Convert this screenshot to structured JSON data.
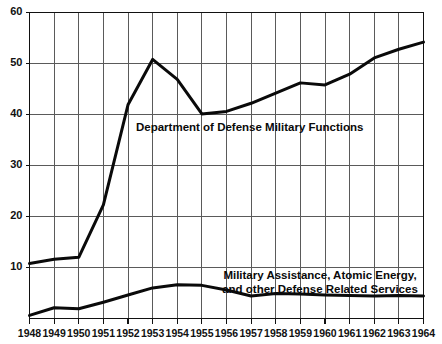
{
  "chart_data": {
    "type": "line",
    "title": "",
    "subtitle": "",
    "xlabel": "",
    "ylabel": "",
    "xlim": [
      1948,
      1964
    ],
    "ylim": [
      0,
      60
    ],
    "grid": true,
    "legend_position": "inline-annotation",
    "x": [
      1948,
      1949,
      1950,
      1951,
      1952,
      1953,
      1954,
      1955,
      1956,
      1957,
      1958,
      1959,
      1960,
      1961,
      1962,
      1963,
      1964
    ],
    "xtick_labels": [
      "1948",
      "1949",
      "1950",
      "1951",
      "1952",
      "1953",
      "1954",
      "1955",
      "1956",
      "1957",
      "1958",
      "1959",
      "1960",
      "1961",
      "1962",
      "1963",
      "1964"
    ],
    "ytick_values": [
      10,
      20,
      30,
      40,
      50,
      60
    ],
    "ytick_labels": [
      "10",
      "20",
      "30",
      "40",
      "50",
      "60"
    ],
    "series": [
      {
        "name": "Department of Defense Military Functions",
        "values": [
          10.8,
          11.6,
          12.0,
          22.3,
          41.9,
          50.8,
          46.9,
          40.1,
          40.6,
          42.2,
          44.2,
          46.2,
          45.8,
          47.9,
          51.1,
          52.8,
          54.2
        ],
        "annotation": "Department of Defense Military Functions"
      },
      {
        "name": "Military Assistance, Atomic Energy, and other Defense Related Services",
        "values": [
          0.6,
          2.1,
          1.9,
          3.2,
          4.6,
          6.0,
          6.6,
          6.5,
          5.6,
          4.4,
          4.9,
          4.8,
          4.6,
          4.5,
          4.4,
          4.5,
          4.4
        ],
        "annotation_line1": "Military Assistance, Atomic Energy,",
        "annotation_line2": "and other Defense Related Services"
      }
    ],
    "colors": {
      "series_line": "#0a0a0a",
      "grid": "#5a5a5a",
      "frame": "#111111",
      "background": "#ffffff",
      "text": "#111111"
    }
  }
}
